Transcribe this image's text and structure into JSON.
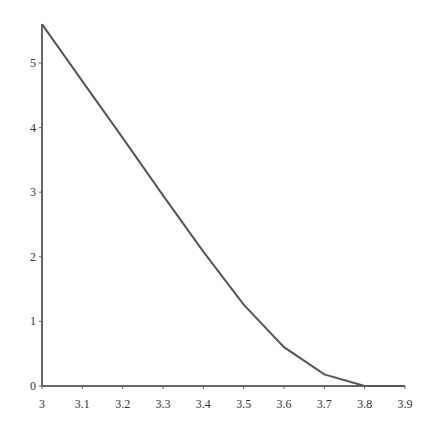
{
  "chart_data": {
    "type": "line",
    "title": "",
    "xlabel": "",
    "ylabel": "",
    "x": [
      3.0,
      3.1,
      3.2,
      3.3,
      3.4,
      3.5,
      3.6,
      3.7,
      3.8,
      3.9
    ],
    "series": [
      {
        "name": "curve",
        "values": [
          5.6,
          4.72,
          3.84,
          2.95,
          2.08,
          1.26,
          0.6,
          0.18,
          0.0,
          0.0
        ]
      }
    ],
    "xlim": [
      3.0,
      3.9
    ],
    "ylim": [
      0,
      5.6
    ],
    "xticks": [
      "3",
      "3.1",
      "3.2",
      "3.3",
      "3.4",
      "3.5",
      "3.6",
      "3.7",
      "3.8",
      "3.9"
    ],
    "yticks": [
      "0",
      "1",
      "2",
      "3",
      "4",
      "5"
    ],
    "grid": false,
    "legend": false,
    "line_color": "#555555",
    "axis_color": "#666666"
  }
}
